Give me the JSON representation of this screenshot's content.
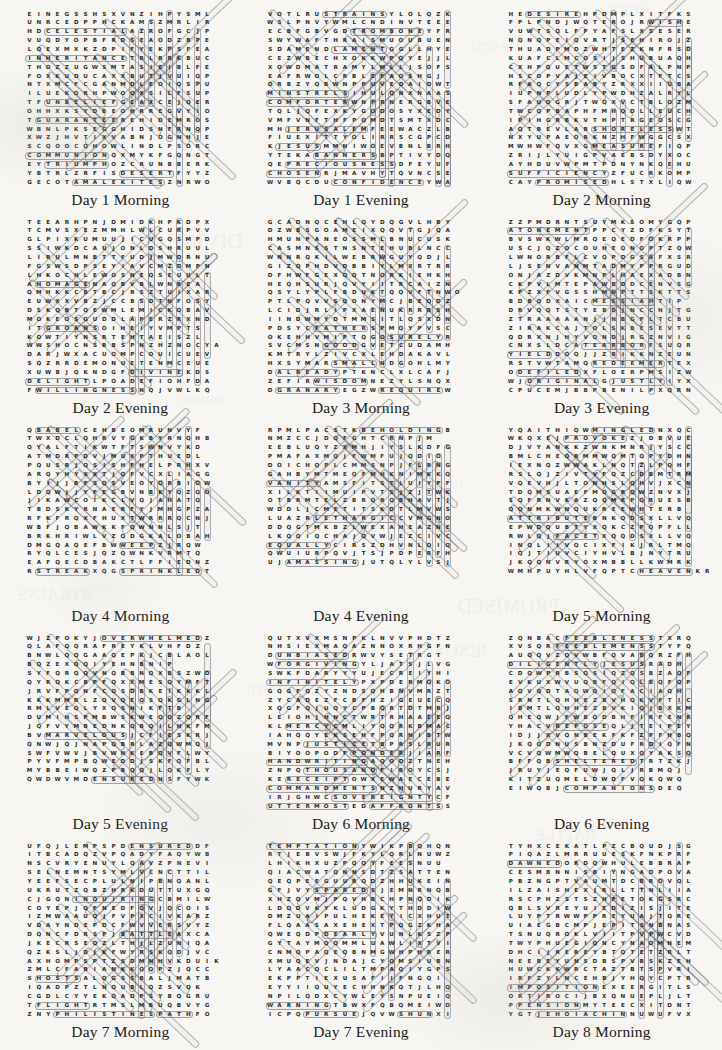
{
  "page": {
    "kind": "word-search-puzzle-sheet",
    "background_color": "#f7f6f3",
    "ink_color": "#2b2b2b",
    "highlight_color": "#6e6e73",
    "columns": 3,
    "rows": 5,
    "grid_size": {
      "cols": 20,
      "rows": 20
    }
  },
  "puzzles": [
    {
      "caption": "Day 1 Morning",
      "rows": [
        "EINEGSSHSXVNZIHPYSML",
        "UNRCEDPPHCKAMSZMRLIR",
        "HDCELESTIALAZROFGCJP",
        "VUQDYOPBFRDSEAODZBPE",
        "LQEXMXKZDPIFYEKPSFEA",
        "INHERITANCETRLRRKBUC",
        "THOZZUGWSMTASIEIBLFE",
        "FOXKUDUCAXXBUTJVUIQP",
        "NTXMCFCGANMDLEOIQSPU",
        "ILUEKORHPWOOXSILFSUP",
        "TFUNBELIEFGEAXCEJQER",
        "OHHXKSYDBEOHRREGVYIO",
        "TGUARANTEEREHIDEMROS",
        "WBNLPKSEGGHIDSNFRNQP",
        "XWZJHVTIXVABNJOGNHJE",
        "SCQOOCQHOWLINDLPSORC",
        "COMMUNIONQXMYKFGQNGT",
        "EYTRIUMPHOZCRUNBBERK",
        "YBTRLZRFISDESERTFYYZ",
        "GECOTAMALEKITESZNRWO"
      ],
      "words": [
        "CELESTIAL",
        "INHERITANCE",
        "UNBELIEF",
        "GUARANTEE",
        "HOWLING",
        "COMMUNION",
        "TRIUMPH",
        "DESERT",
        "AMALEKITES"
      ]
    },
    {
      "caption": "Day 1 Evening",
      "rows": [
        "VOTLRUSTRAINSYLOLQZK",
        "WSLPNVYWMLCNDINVTEEE",
        "ECBFGBVGDTROMBONEYFR",
        "SWYWAFTHRAISMUOUBUEN",
        "SDAMENDLAMENTGGLLHYE",
        "CEZWBECHXOKKWPQYEJJL",
        "XOWDMATRAMYLMLLJSOFS",
        "EAFRWOLCRBLEFAOSHGJ",
        "ORBZYQBWNPPUVEDAIDWT",
        "MINSTRELSIHULQNXNAAS",
        "COMFORTERWNPRNERGBVE",
        "TQLJQFEXKYGODOSYXEDY",
        "VMFVNFTHFPQMDTSMTXDC",
        "MHJERUSALEMFEEWACZLB",
        "FIUEXITTYOLIRRSCGPCD",
        "KJESUSMMNIWOEVBNLBRH",
        "YTEKABANNERSBPTIVYDQ",
        "QEPRECIOUSNESSDFEYUF",
        "CHOSENRJMAVHYTQVNCSE",
        "WVBQCDUCONFIDENCEYWA"
      ],
      "words": [
        "STRAINS",
        "TROMBONE",
        "LAMENT",
        "MINSTRELS",
        "COMFORTER",
        "JERUSALEM",
        "JESUS",
        "BANNERS",
        "PRECIOUSNESS",
        "CHOSEN",
        "CONFIDENCE"
      ]
    },
    {
      "caption": "Day 2 Morning",
      "rows": [
        "HEDESIREHPDMPLXITFKS",
        "FPLPNDJWQTEROJRWISHE",
        "VUWTSQLFPYAFSLXSESER",
        "NQNQPEIQVRTJSEHIROJZ",
        "THUADPMDZWHTEZKNFRSD",
        "KUAFCLMCOSIJSHUBUAQH",
        "CXHPQUETWSTGSDFALPNP",
        "HSCOPVAJEIVBOCXTFTCS",
        "RFAQCYSBABYZRXXIIUBA",
        "IUPNPLUDLYPWDHZALRYL",
        "SFAUOGRJTWQXVCTBLOZM",
        "TWCQPBAPHFMHQDLLEUCH",
        "IPIHGRBKVTHPTRGEOSCG",
        "AQTBEVLABSHORELESSWT",
        "NXYUPAEORKNZHFWGGCSX",
        "MWHWFQVXGMEASUREFIQP",
        "ZRIJLYUIGPVAEBSDYXOC",
        "AYHDUVWPMTPDNYNKQEHU",
        "SUFFICIENCYZFUCRKOMP",
        "CAYPROMISEDHLSTXLIQW"
      ],
      "words": [
        "DESIRE",
        "WISH",
        "SHORELESS",
        "MEASURE",
        "SUFFICIENCY",
        "PROMISED"
      ]
    },
    {
      "caption": "Day 2 Evening",
      "rows": [
        "TEEARHPNJDMIDKHPKDPX",
        "TCMVSXEZMMHLWLCURPVV",
        "GLPIXKUMUUJICUGQSMPD",
        "SSIWKDCAUJONLDSHRUUL",
        "LIRULMNBTTFUDJMWDRNU",
        "FGSWSDPSEYIAVCMZDMPN",
        "LHKOCHLEWOSNEQSEUULT",
        "AHOMAGENAQBVBLWNREA",
        "QMHKKCBTBCJRSZTUIXAR",
        "EUWXXVBZJCCBSDTNFOSY",
        "DSKQBTQEWMLEMICKOBAV",
        "MOKEOSGUDDLAPERZRXND",
        "ITGROANSOIHEIYVMPTS",
        "KOWTIYNSRTEHTAEISZL",
        "WWSHOCNSBBSPNZHZNOCYA",
        "DARJWXACUOMPCOUICUEV",
        "SQZRRDEMONUETENMCEUE",
        "XUWBJQKNDGFDIVINEKDS",
        "DELIGHTLPOADEFIOHFDA",
        "FWILLINGNESSNQJVWLKQ"
      ],
      "words": [
        "HOMAGE",
        "GROANS",
        "DIVINE",
        "DELIGHT",
        "WILLINGNESS"
      ]
    },
    {
      "caption": "Day 3 Morning",
      "rows": [
        "GCADNQCEHLQYDQGVLHBY",
        "DZWBSGOAMEIXQQVTGJQA",
        "HMUNPANEOSSMLBNUCUSK",
        "CASMNSSTNSNTEHUBLNCC",
        "WNNRQKILWEBRWGUYQDJL",
        "GIZQPHDVDBBIYLMXRTRR",
        "DFHWFGEXQQTNORKIEHKH",
        "HEQHSURJQVYIITRCAIZN",
        "QSYLYPLFBDUKTQQVFTNWO",
        "PTLPQVVSQONYMCJBEQDZ",
        "LCIDJRLIPXAENUKRRRSH",
        "IINDWMYDTMMSITLQSXDN",
        "PDSYCFATHERSPMQYPVSC",
        "OKEHHVMIPTQGOSURELYR",
        "SVCMSNGOODGVETCUDAMH",
        "KMTRYLZIVCXLEHDAKAVL",
        "HXSYMARSMALLNDGOHLMY",
        "DALREADYPTKNCLXLCAFJ",
        "ZEFIRWISDOMNEZYLSNQX",
        "DGRANARYEGZWREQUIREW"
      ],
      "words": [
        "FATHER",
        "SURELY",
        "GOOD",
        "SMALL",
        "ALREADY",
        "WISDOM",
        "GRANARY",
        "REQUIRE"
      ]
    },
    {
      "caption": "Day 3 Evening",
      "rows": [
        "ZZPMDRNTSUYMKSOMYGQP",
        "ATONEMENTPPCYZDFKSYT",
        "BVSWKWLMRQEQEDFOKRPP",
        "USCJQZOCOUHEQNOPTZQW",
        "LWNORBFLCVQPDGSAFXSR",
        "LJSENVANMTADMYPPRGUD",
        "ONJAZDVKMNPLHAEXADBN",
        "CKPVLMTEPAWBDDCENVSG",
        "KPZXFVGSSHMNPTTSKTTS",
        "BDBQDXAICMESSIAHTIP",
        "DRVQQTSTYEBDJNCCNJTG",
        "ZTRAAAAANJJNBGPLTCBU",
        "ZIRAKCAJTOLSKBESEVTT",
        "QDRXNJHYVQNDJRGZNVIG",
        "CNXSLDCATEARBORFSUQR",
        "YIELDDOQJJZBIKKNZEUN",
        "RSTVWTAMQREDEEMERTEX",
        "ODEFILEDXFLOERPMSIZW",
        "WJORIGINALGJUSTLYIYX",
        "CPUCEMJBBPBENILPXQRN"
      ],
      "words": [
        "ATONEMENT",
        "MESSIAH",
        "TEARBOR",
        "YIELD",
        "REDEEMER",
        "DEFILED",
        "ORIGINAL",
        "JUSTLY"
      ]
    },
    {
      "caption": "Day 4 Morning",
      "rows": [
        "QBABELCEHBEOMRUNVYF",
        "TWXDCLQHRVYGKBYRNQHB",
        "QYALFTIKWTFTSWNVYKD",
        "ATMDRPDVJMUXPTHUEDL",
        "PQUSRJQSISHFHELPRHXV",
        "ARQYHYXXTJQFVCXLIAGG",
        "BYIJJBFSQSVEOYQRBIOW",
        "LDQWJJYFEGBVNBKYQZQO",
        "JIKAWCOIKCLVQJAHATQ",
        "TBDSKYRNAERFYJMHGPZA",
        "RFKFRQXFHUXTWRRRQCNJ",
        "WBFJQBAWKKFQWNNLSJT",
        "BRKHRIWLVZQDGKALOBAH",
        "DMGQAQEFBWWEEPZJRQW",
        "RYQLCESJQZQWNKVRMTQ",
        "EAFQECDBAKCTLFFIEDNZ",
        "RSTREAKXQGSPRINKLEDT"
      ],
      "words": [
        "BABEL",
        "WEEP",
        "STREAK",
        "SPRINKLED"
      ]
    },
    {
      "caption": "Day 4 Evening",
      "rows": [
        "RPMLPACSTKBEHOLDINGB",
        "NMZCCJDQFGHTCRNPJM",
        "EEBLUQYZXMHJIYSLKDFG",
        "PMAFAXMQJFWMFUJQDIO",
        "DOICHQPLCMMSNPJFLRNG",
        "GAHBYMTMEQFMHKNIMKKQ",
        "VANITYAMSFITSTLUIYPF",
        "XILKTIIMUIPVTSJZJTWK",
        "OTBRMTELZBRQRQBHAVTJ",
        "WDDLJCMETITSKDTLMVWS",
        "LUAZRLETHARGICCVMGNO",
        "DDQGTMKBZLWEXAHEAZNE",
        "LKQQIQCHAJQVWJEZCIVC",
        "EQUALLYCIRSZDHVNLQIQ",
        "QWUIURPQVJTSJPDPERFH",
        "UJAMASSINGJUTQLYLVSJ"
      ],
      "words": [
        "BEHOLDING",
        "VANITY",
        "LETHARGIC",
        "EQUALLY",
        "AMASSING"
      ]
    },
    {
      "caption": "Day 5 Morning",
      "rows": [
        "YQAITHIQWMINGLEDNXQC",
        "WKQXEJPROVOKEZJDBVUE",
        "DJVYANKKZWNKMNRJYSCC",
        "BMLCHEQRMMWQMTQPYDHN",
        "IEXNQZWWAKLNQTZLPQHF",
        "RSLQJZIVTVFQZCDBMTRM",
        "VQEVHJLTONHSLQHVJXCN",
        "TDQMSUAEFMQGRQWZNVXJ",
        "SQFRNVKAZQQMRPQRUESB",
        "QQNMKWNQUKREEWHTERB",
        "ATTRIBUTEBNKQDSXLLVQ",
        "EPWDQUBTYXQKCZPQPFLL",
        "RWLQJFACETXQQDSXLLVQ",
        "INQLIIVQCIXFIKJRLTMQ",
        "IQJTIUVCIYHVLBJNYTRU",
        "JKQQNVRYOXMBBLLKWMRK",
        "WMHPUYHLVFQPTCHEAVENKR"
      ],
      "words": [
        "MINGLED",
        "PROVOKE",
        "ATTRIBUTE",
        "FACET",
        "HEAVEN"
      ]
    },
    {
      "caption": "Day 5 Evening",
      "rows": [
        "WJZPOKYJOVERWHELMEDZ",
        "QLAFQQRAFREYKLVHFDZ",
        "BNWLQQGAAQEPKJCBLAOL",
        "BQZEXQQIYEHNBNIP",
        "SYFQRQQVNQBBNQXBSZWD",
        "QYRQKCBPFQXXMESQYMFT",
        "JRVFPQNFCQSDBKEIKKKL",
        "KKKMMRLZQVQEQSQKGLNG",
        "RMLVEQLYXQSNIKFTB",
        "DUMIHSPMBWSKWEQOZQRF",
        "JQFVYMBEDNKQBQILHKFM",
        "BVMARVELOUSJCFIESKRJ",
        "QNWJQJNAPQBRLAZQWMQJ",
        "SWFVWVJBVWNKEBQVFLWY",
        "PYVFMPBQWEDDJSKFQFBL",
        "MYBBEIWQZPBQQJLQKFLY",
        "QWDWVMDENSUREDNSFYWK"
      ],
      "words": [
        "OVERWHELMED",
        "MARVELOUS",
        "ENSURED"
      ]
    },
    {
      "caption": "Day 6 Morning",
      "rows": [
        "QUTXVXMSNPKLNVVPHDTZ",
        "NHSIEXMAQAZNNOXRHGFN",
        "DUNBIASEDRWVYSETRGT",
        "WFORGIVINGYLJATSJLVG",
        "SWKFDARYYYUJECREIYHI",
        "INFINITELYPXPDERMQKO",
        "GQGFQZYZNDSQHBNVMRZT",
        "ZYCADEZFCBFHZIGEUECQ",
        "XQGFQJUQYCPBQRTDTMRJ",
        "LEIOHJHNCTWRTRHAAEEQ",
        "KLMERCYCMLIYQQRKBMAC",
        "IAHQQYEKSEHFPQRNIBTW",
        "MVNPJUSTICETBPRSLRUR",
        "BIYOOPODFPONDERJIARF",
        "HANDWRITINGAQODZTNEH",
        "ZNPQTHOUSANDFIROYCSJ",
        "KERECEIPTOWXEWAECEBE",
        "COMMANDMENTSNZHURYAV",
        "IRJGHWCSOVEREIGNTYCF",
        "UTTERMOSTEDAFFRONTSS"
      ],
      "words": [
        "UNBIASED",
        "FORGIVING",
        "INFINITELY",
        "MERCY",
        "JUSTICE",
        "PONDER",
        "HANDWRITING",
        "THOUSAND",
        "RECEIPT",
        "COMMANDMENTS",
        "SOVEREIGNTY",
        "UTTERMOST",
        "AFFRONTS"
      ]
    },
    {
      "caption": "Day 6 Evening",
      "rows": [
        "ZQNBACFEEBLENESSTXRQ",
        "XVSQRFEEBLEMENSSTYFQ",
        "AUQQVZQVWBFQVABQRZFH",
        "DILIGENTLYJESUSRADH",
        "CDQWPRBSQSIQZQSBZAQF",
        "EVKUXWVUQBFQIQLBQFQP",
        "AQVQDTAQWQIQFACIAQH",
        "SRNTLQHHEZBVHQKVFTIC",
        "IBMTLQHHEZBVKIQJBXKM",
        "QHEQWJFWBQDBHFIRFENR",
        "YHACVREPOSEQLJTEIPEY",
        "IDJJXVQNBEKFKFZPFHBQ",
        "JKQQDNUSBNZDUFRDIQFN",
        "VCVQWMWQBELQUXQYAKSQ",
        "BFFQBSHELTEREDTRTZKJ",
        "JRUYJEQFUWJQLJRBMQJ",
        "KITZUQMELDWDFVQKQWQ",
        "EIWQBJCOMPANIONSDEQ"
      ],
      "words": [
        "FEEBLENESS",
        "FEEBLEMENSS",
        "DILIGENTLY",
        "JESUS",
        "REPOSE",
        "SHELTERED",
        "COMPANIONS"
      ]
    },
    {
      "caption": "Day 7 Morning",
      "rows": [
        "UFQJLEMPSPDENSUREDDF",
        "ITBCADQZVPQADYFAQYWB",
        "NSCVRYENUYLQAVZPNEVI",
        "SELNEMNTSYMLVCNCTTIL",
        "YEEFSECPLULNIPBNQANL",
        "UKRUTZQBZHRKDUTTUXGQ",
        "CJGQNINQUIRINGCBMILW",
        "COYEPJQFNEDFQVJQCOIS",
        "IZMWAAUQJFVPXCIVKARZ",
        "VDAYNDEPDCFWVVERSVYZ",
        "DQNCFDRSPJBATTLEAXCA",
        "JKECRSEQZLTHJLZUNIQA",
        "QZKSLJDJKFWYRSKQDJVC",
        "AXHOMPSPTZSDMNHVKDUIK",
        "ZMLCFABIANKKQQPZJQCC",
        "SHOSTSALQGSSBALJMATB",
        "IQADPZTLNQUBLQZSVQK",
        "CGDLCYYEKQADPSYBQGRU",
        "TFLIGHTRTMSLMBUQBVYG",
        "ZNYPHILISTINESPATHFO"
      ],
      "words": [
        "ENSURED",
        "INQUIRING",
        "BATTLE",
        "HOSTS",
        "FLIGHT",
        "PHILISTINES",
        "PATH"
      ]
    },
    {
      "caption": "Day 7 Evening",
      "rows": [
        "TEMPTATIONYWIKPBQHQN",
        "RTJEBVSWJFKYLQRLNUWZ",
        "LHIKHXUZPQQYFEESNUU",
        "QIACWATQNNSDTZSATTEN",
        "QEQPEEGUURQDZHHUKEIN",
        "GFJVYSPAREDSJEMNRNQB",
        "XHZQVMJPQVHBCHPNQDIK",
        "LDQDVKYKLUDGKYTHDDIW",
        "DMZUAIPULHEKEYICXHUT",
        "FLQAASAXEHEXTPQGZKHA",
        "QWEQDPDEARLYVUNLKSZP",
        "GYTAYMQQMMLUAWLIXTVI",
        "CNMQPAQEQBNMGWHPHRER",
        "XMUQEVJNDAJCYQMSIUBN",
        "LYAACQCLILTMPAQIYGPS",
        "EKPPTIEXUSAFIIFNGQI",
        "EYYIIQUYECHHNKQTJLHQ",
        "NPILQDXCYWLEYSNPUEIQ",
        "WARNINGTBWXFQBQMEIWD",
        "ICPQPURSUEJQVWSHUNXI"
      ],
      "words": [
        "TEMPTATION",
        "SPARED",
        "DEARLY",
        "WARNING",
        "PURSUE",
        "SHUN"
      ]
    },
    {
      "caption": "Day 8 Morning",
      "rows": [
        "TYHXCEKATLPZCBQUDJSG",
        "PIQAZLMRRUUESKFNKPRF",
        "DAWNEDORDQWHULEBBRAP",
        "CESMBNNISBIYNGADPOVA",
        "PBZNGPTVAUMTDCBROVQL",
        "ILZAISHEXJRLLTTNLIIA",
        "RSCPHZSTSZHPETOKGSRC",
        "QBLSVREYUIEDIZISJITE",
        "LUYPTRWWPPREYUAJTQRE",
        "UIAEGBCMPJEPITSNBNAS",
        "TSNUQROKLVIITPVPWCVD",
        "TWYPHUEGIQNCYNAOMNEM",
        "DHCIJREREYBTQTETZRLT",
        "NEEBEYUNSDBSPVBSKZEH",
        "HUWCKKWRCTAZTBTSPVRI",
        "IRFZYLNCEHBJYHQYCPTR",
        "IMPOSITIONEXEERGITLS",
        "ORTIROCIJBXQNUEPLJLT",
        "PPENSIONMYTEECXITDNT",
        "YGTJEHOIACHINNUWUFVX"
      ],
      "words": [
        "DAWNED",
        "IMPOSITION",
        "PENSION",
        "JEHOIACHIN"
      ]
    }
  ]
}
